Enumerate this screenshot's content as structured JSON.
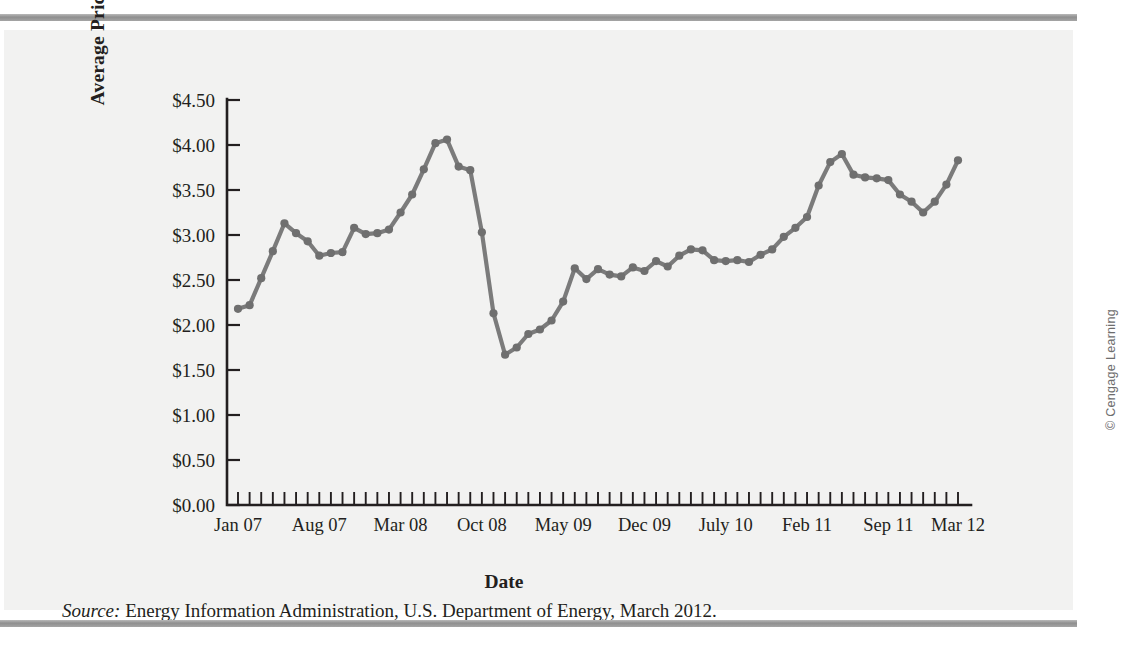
{
  "figure": {
    "credit": "© Cengage Learning",
    "source_keyword": "Source:",
    "source_text": " Energy Information Administration, U.S. Department of Energy, March 2012."
  },
  "chart_data": {
    "type": "line",
    "title": "",
    "xlabel": "Date",
    "ylabel": "Average Price per Gallon",
    "ylim": [
      0,
      4.5
    ],
    "ytick_labels": [
      "$0.00",
      "$0.50",
      "$1.00",
      "$1.50",
      "$2.00",
      "$2.50",
      "$3.00",
      "$3.50",
      "$4.00",
      "$4.50"
    ],
    "ytick_values": [
      0,
      0.5,
      1.0,
      1.5,
      2.0,
      2.5,
      3.0,
      3.5,
      4.0,
      4.5
    ],
    "xtick_labels": [
      "Jan 07",
      "Aug 07",
      "Mar 08",
      "Oct 08",
      "May 09",
      "Dec 09",
      "July 10",
      "Feb 11",
      "Sep 11",
      "Mar 12"
    ],
    "xtick_indices": [
      0,
      7,
      14,
      21,
      28,
      35,
      42,
      49,
      56,
      62
    ],
    "grid": false,
    "legend": false,
    "marker": "circle",
    "line_color": "#7b7b7b",
    "marker_color": "#6f6f6f",
    "n_points": 63,
    "x": [
      "Jan 07",
      "Feb 07",
      "Mar 07",
      "Apr 07",
      "May 07",
      "Jun 07",
      "Jul 07",
      "Aug 07",
      "Sep 07",
      "Oct 07",
      "Nov 07",
      "Dec 07",
      "Jan 08",
      "Feb 08",
      "Mar 08",
      "Apr 08",
      "May 08",
      "Jun 08",
      "Jul 08",
      "Aug 08",
      "Sep 08",
      "Oct 08",
      "Nov 08",
      "Dec 08",
      "Jan 09",
      "Feb 09",
      "Mar 09",
      "Apr 09",
      "May 09",
      "Jun 09",
      "Jul 09",
      "Aug 09",
      "Sep 09",
      "Oct 09",
      "Nov 09",
      "Dec 09",
      "Jan 10",
      "Feb 10",
      "Mar 10",
      "Apr 10",
      "May 10",
      "Jun 10",
      "Jul 10",
      "Aug 10",
      "Sep 10",
      "Oct 10",
      "Nov 10",
      "Dec 10",
      "Jan 11",
      "Feb 11",
      "Mar 11",
      "Apr 11",
      "May 11",
      "Jun 11",
      "Jul 11",
      "Aug 11",
      "Sep 11",
      "Oct 11",
      "Nov 11",
      "Dec 11",
      "Jan 12",
      "Feb 12",
      "Mar 12"
    ],
    "values": [
      2.18,
      2.22,
      2.52,
      2.82,
      3.13,
      3.02,
      2.93,
      2.77,
      2.8,
      2.81,
      3.08,
      3.01,
      3.02,
      3.06,
      3.25,
      3.45,
      3.73,
      4.02,
      4.06,
      3.76,
      3.72,
      3.03,
      2.13,
      1.67,
      1.75,
      1.9,
      1.95,
      2.05,
      2.26,
      2.63,
      2.51,
      2.62,
      2.56,
      2.54,
      2.64,
      2.6,
      2.71,
      2.65,
      2.77,
      2.84,
      2.83,
      2.72,
      2.71,
      2.72,
      2.7,
      2.78,
      2.84,
      2.98,
      3.08,
      3.2,
      3.55,
      3.81,
      3.9,
      3.67,
      3.64,
      3.63,
      3.61,
      3.45,
      3.37,
      3.25,
      3.37,
      3.56,
      3.83
    ]
  }
}
